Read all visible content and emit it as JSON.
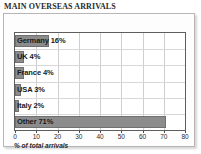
{
  "chart_data": {
    "type": "bar",
    "orientation": "horizontal",
    "title": "MAIN OVERSEAS ARRIVALS",
    "xlabel": "% of total arrivals",
    "ylabel": "",
    "xlim": [
      0,
      80
    ],
    "xticks": [
      0,
      10,
      20,
      30,
      40,
      50,
      60,
      70,
      80
    ],
    "xtick_labels": [
      "0",
      "10",
      "20",
      "30",
      "40",
      "50",
      "60",
      "70",
      "80"
    ],
    "grid": true,
    "legend": "none",
    "categories": [
      "Germany",
      "UK",
      "France",
      "USA",
      "Italy",
      "Other"
    ],
    "values": [
      16,
      4,
      4,
      3,
      2,
      71
    ],
    "bar_labels": [
      "Germany 16%",
      "UK 4%",
      "France 4%",
      "USA 3%",
      "Italy 2%",
      "Other  71%"
    ],
    "bar_color": "#8c8c8c",
    "bar_edge_color": "#707070",
    "plot_background": "#ffffff",
    "grid_color": "#cfcfcf"
  },
  "panel": {
    "border_color": "#b6b6b6"
  }
}
